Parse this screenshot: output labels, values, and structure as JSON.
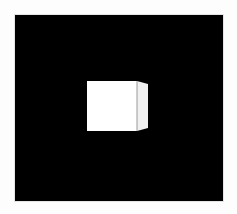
{
  "scene": {
    "background_color": "#000000",
    "frame_color": "#ffffff",
    "object": {
      "type": "cube",
      "front_face_color": "#ffffff",
      "side_face_color": "#f2f2f2",
      "edge_color": "#9a9a9a"
    }
  }
}
